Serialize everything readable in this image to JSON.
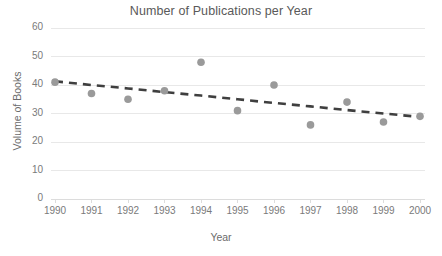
{
  "chart_data": {
    "type": "scatter",
    "title": "Number of Publications per Year",
    "xlabel": "Year",
    "ylabel": "Volume of Books",
    "categories": [
      1990,
      1991,
      1992,
      1993,
      1994,
      1995,
      1996,
      1997,
      1998,
      1999,
      2000
    ],
    "x": [
      1990,
      1991,
      1992,
      1993,
      1994,
      1995,
      1996,
      1997,
      1998,
      1999,
      2000
    ],
    "values": [
      41,
      37,
      35,
      38,
      48,
      31,
      40,
      26,
      34,
      27,
      29
    ],
    "series": [
      {
        "name": "Volume of Books",
        "values": [
          41,
          37,
          35,
          38,
          48,
          31,
          40,
          26,
          34,
          27,
          29
        ]
      },
      {
        "name": "Linear trendline",
        "type": "line",
        "style": "dashed",
        "values": [
          41.3,
          40.0,
          38.8,
          37.5,
          36.3,
          35.0,
          33.7,
          32.5,
          31.2,
          30.0,
          28.8
        ]
      }
    ],
    "xlim": [
      1990,
      2000
    ],
    "ylim": [
      0,
      60
    ],
    "ytick_labels": [
      "0",
      "10",
      "20",
      "30",
      "40",
      "50",
      "60"
    ],
    "ytick_values": [
      0,
      10,
      20,
      30,
      40,
      50,
      60
    ],
    "xtick_labels": [
      "1990",
      "1991",
      "1992",
      "1993",
      "1994",
      "1995",
      "1996",
      "1997",
      "1998",
      "1999",
      "2000"
    ],
    "grid": "horizontal",
    "legend": "none",
    "colors": {
      "marker": "#9a9a9a",
      "trendline": "#3f3f3f",
      "gridline": "#e8e8e8",
      "axis_text": "#7a7a7a",
      "title_text": "#595959",
      "background": "#ffffff"
    }
  }
}
